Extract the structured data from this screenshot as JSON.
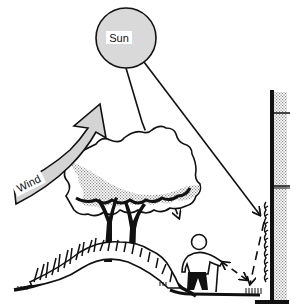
{
  "diagram": {
    "type": "microclimate-illustration",
    "labels": {
      "sun": "Sun",
      "wind": "Wind"
    },
    "elements": [
      {
        "name": "sun",
        "shape": "circle",
        "fill": "#d9d9d9"
      },
      {
        "name": "wind-arrow",
        "shape": "curved-arrow",
        "fill": "#d4d4d4"
      },
      {
        "name": "tree-canopy",
        "shape": "blob",
        "fill": "stippled-gray"
      },
      {
        "name": "tree-trunks",
        "count": 2
      },
      {
        "name": "shrubs-on-mound",
        "shape": "hatched-hill"
      },
      {
        "name": "person-with-cane"
      },
      {
        "name": "building-wall",
        "fill": "stippled-gray"
      },
      {
        "name": "wall-vine"
      },
      {
        "name": "solar-ray-direct",
        "style": "solid",
        "target": "wall"
      },
      {
        "name": "solar-ray-filtered",
        "style": "dashed",
        "target": "ground-under-tree"
      },
      {
        "name": "reflected-ray",
        "style": "dashed",
        "from": "wall",
        "to": "ground"
      },
      {
        "name": "reradiation-arrow",
        "style": "dashed-double-arrow",
        "between": "ground-and-person"
      }
    ],
    "colors": {
      "ink": "#111111",
      "sun_fill": "#d9d9d9",
      "wind_fill": "#d4d4d4",
      "stipple": "#bdbdbd",
      "background": "#ffffff"
    }
  }
}
